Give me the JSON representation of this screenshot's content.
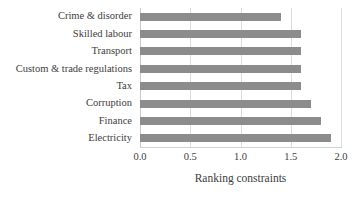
{
  "chart_data": {
    "type": "bar",
    "orientation": "horizontal",
    "title": "",
    "xlabel": "Ranking constraints",
    "ylabel": "",
    "xlim": [
      0.0,
      2.0
    ],
    "xticks": [
      "0.0",
      "0.5",
      "1.0",
      "1.5",
      "2.0"
    ],
    "xtick_values": [
      0.0,
      0.5,
      1.0,
      1.5,
      2.0
    ],
    "grid": "vertical",
    "legend": "none",
    "bar_color": "#8c8c8c",
    "gridline_color": "#dcdcdc",
    "categories": [
      "Crime & disorder",
      "Skilled labour",
      "Transport",
      "Custom & trade regulations",
      "Tax",
      "Corruption",
      "Finance",
      "Electricity"
    ],
    "values": [
      1.4,
      1.6,
      1.6,
      1.6,
      1.6,
      1.7,
      1.8,
      1.9
    ]
  }
}
